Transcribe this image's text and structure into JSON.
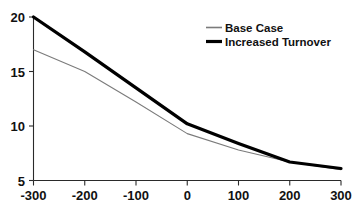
{
  "chart_data": {
    "type": "line",
    "title": "",
    "subtitle": "",
    "xlabel": "",
    "ylabel": "",
    "x": [
      -300,
      -200,
      -100,
      0,
      100,
      200,
      300
    ],
    "xlim": [
      -300,
      300
    ],
    "ylim": [
      5,
      20
    ],
    "xticks": [
      -300,
      -200,
      -100,
      0,
      100,
      200,
      300
    ],
    "yticks": [
      5,
      10,
      15,
      20
    ],
    "xtick_labels": [
      "-300",
      "-200",
      "-100",
      "0",
      "100",
      "200",
      "300"
    ],
    "ytick_labels": [
      "5",
      "10",
      "15",
      "20"
    ],
    "grid": false,
    "legend_position": "top-right",
    "series": [
      {
        "name": "Base Case",
        "values": [
          17.0,
          15.0,
          12.2,
          9.3,
          7.8,
          6.7,
          6.0
        ],
        "color": "#7b7b7b",
        "style": "thin"
      },
      {
        "name": "Increased Turnover",
        "values": [
          20.0,
          16.8,
          13.5,
          10.2,
          8.4,
          6.7,
          6.1
        ],
        "color": "#000000",
        "style": "thick"
      }
    ]
  },
  "legend": {
    "entries": [
      {
        "label": "Base Case"
      },
      {
        "label": "Increased Turnover"
      }
    ]
  },
  "axes": {
    "y": {
      "labels": [
        "20",
        "15",
        "10",
        "5"
      ]
    },
    "x": {
      "labels": [
        "-300",
        "-200",
        "-100",
        "0",
        "100",
        "200",
        "300"
      ]
    }
  }
}
